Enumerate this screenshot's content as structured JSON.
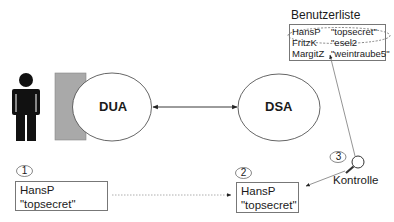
{
  "diagram": {
    "nodes": {
      "dua": {
        "label": "DUA"
      },
      "dsa": {
        "label": "DSA"
      }
    },
    "user_list": {
      "title": "Benutzerliste",
      "entries": [
        {
          "user": "HansP",
          "password": "\"topsecret\""
        },
        {
          "user": "FritzK",
          "password": "\"esel2"
        },
        {
          "user": "MargitZ",
          "password": "\"weintraube5\""
        }
      ]
    },
    "steps": [
      {
        "number": "1",
        "user": "HansP",
        "password": "\"topsecret\""
      },
      {
        "number": "2",
        "user": "HansP",
        "password": "\"topsecret\""
      },
      {
        "number": "3",
        "caption": "Kontrolle"
      }
    ],
    "icons": {
      "person": "person-icon",
      "terminal": "terminal-block",
      "check": "magnifier-icon"
    },
    "colors": {
      "stroke": "#555555",
      "terminal_fill": "#a9a9a9",
      "person_fill": "#111111"
    }
  }
}
